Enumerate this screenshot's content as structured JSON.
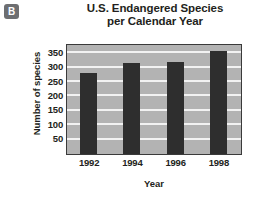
{
  "panel": {
    "label": "B"
  },
  "chart_data": {
    "type": "bar",
    "title": "U.S. Endangered Species per Calendar Year",
    "title_line1": "U.S. Endangered Species",
    "title_line2": "per Calendar Year",
    "xlabel": "Year",
    "ylabel": "Number of species",
    "categories": [
      "1992",
      "1994",
      "1996",
      "1998"
    ],
    "values": [
      283,
      315,
      318,
      358
    ],
    "ylim": [
      0,
      375
    ],
    "yticks": [
      50,
      100,
      150,
      200,
      250,
      300,
      350
    ],
    "ytick_labels": [
      "50",
      "100",
      "150",
      "200",
      "250",
      "300",
      "350"
    ],
    "grid": true,
    "grid_axis": "y",
    "legend": false,
    "series": [
      {
        "name": "Number of species",
        "values": [
          283,
          315,
          318,
          358
        ]
      }
    ],
    "colors": {
      "bar": "#2e2e2e",
      "plot_background": "#b3b3b3",
      "gridline": "#f2f2f2",
      "frame": "#3a3a3a",
      "text": "#231f20",
      "badge_background": "#6d6e71",
      "badge_text": "#ffffff"
    }
  }
}
